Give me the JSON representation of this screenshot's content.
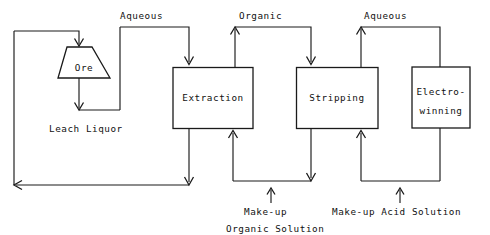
{
  "diagram": {
    "type": "process-flow-diagram",
    "line_color": "#1a1a1a",
    "background_color": "#ffffff",
    "units": [
      {
        "id": "ore",
        "label": "Ore",
        "shape": "trapezoid"
      },
      {
        "id": "extraction",
        "label": "Extraction",
        "shape": "rectangle"
      },
      {
        "id": "stripping",
        "label": "Stripping",
        "shape": "rectangle"
      },
      {
        "id": "electrowinning",
        "label_line1": "Electro-",
        "label_line2": "winning",
        "shape": "rectangle"
      }
    ],
    "stream_labels": [
      {
        "id": "aqueous-left",
        "text": "Aqueous"
      },
      {
        "id": "organic",
        "text": "Organic"
      },
      {
        "id": "aqueous-right",
        "text": "Aqueous"
      },
      {
        "id": "leach-liquor",
        "text": "Leach Liquor"
      }
    ],
    "feed_labels": [
      {
        "id": "makeup-organic-line1",
        "text": "Make-up"
      },
      {
        "id": "makeup-organic-line2",
        "text": "Organic Solution"
      },
      {
        "id": "makeup-acid",
        "text": "Make-up Acid Solution"
      }
    ]
  }
}
